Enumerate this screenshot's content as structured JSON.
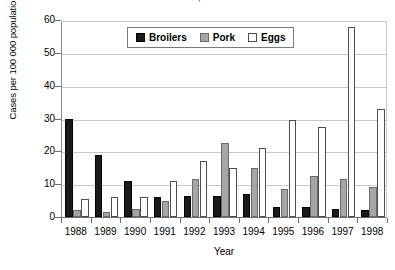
{
  "chart_data": {
    "type": "bar",
    "title": "in Denmark, 1988-1998",
    "xlabel": "Year",
    "ylabel": "Cases per 100 000 population",
    "ylim": [
      0,
      60
    ],
    "ytick_step": 10,
    "yticks": [
      0,
      10,
      20,
      30,
      40,
      50,
      60
    ],
    "grid": true,
    "legend_position": "top-center",
    "categories": [
      "1988",
      "1989",
      "1990",
      "1991",
      "1992",
      "1993",
      "1994",
      "1995",
      "1996",
      "1997",
      "1998"
    ],
    "series": [
      {
        "name": "Broilers",
        "color": "#1a1a1a",
        "values": [
          30,
          19,
          11,
          6,
          6.5,
          6.5,
          7,
          3,
          3,
          2.5,
          2
        ]
      },
      {
        "name": "Pork",
        "color": "#a6a6a6",
        "values": [
          2,
          1.5,
          2.5,
          5,
          11.5,
          22.5,
          15,
          8.5,
          12.5,
          11.5,
          9
        ]
      },
      {
        "name": "Eggs",
        "color": "#ffffff",
        "values": [
          5.5,
          6,
          6,
          11,
          17,
          15,
          21,
          29.5,
          27.5,
          58,
          33
        ]
      }
    ]
  },
  "legend": {
    "items": [
      {
        "label": "Broilers",
        "swatch": "broilers"
      },
      {
        "label": "Pork",
        "swatch": "pork"
      },
      {
        "label": "Eggs",
        "swatch": "eggs"
      }
    ]
  }
}
